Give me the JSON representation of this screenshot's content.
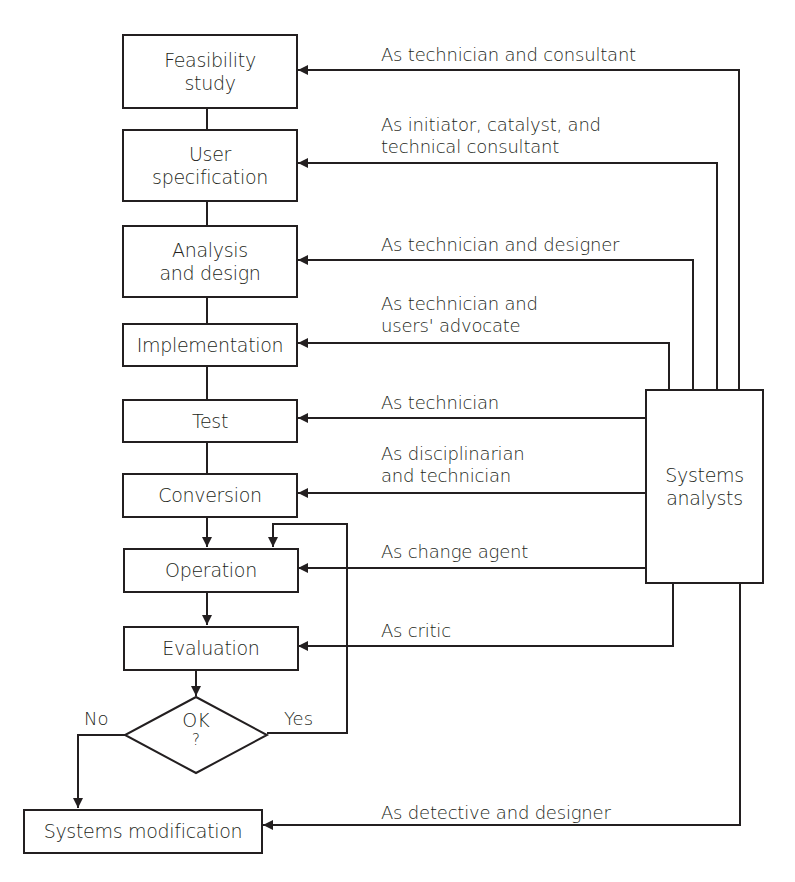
{
  "diagram": {
    "type": "flowchart",
    "stages": [
      {
        "id": "feasibility",
        "lines": [
          "Feasibility",
          "study"
        ]
      },
      {
        "id": "user-spec",
        "lines": [
          "User",
          "specification"
        ]
      },
      {
        "id": "analysis",
        "lines": [
          "Analysis",
          "and design"
        ]
      },
      {
        "id": "implementation",
        "lines": [
          "Implementation"
        ]
      },
      {
        "id": "test",
        "lines": [
          "Test"
        ]
      },
      {
        "id": "conversion",
        "lines": [
          "Conversion"
        ]
      },
      {
        "id": "operation",
        "lines": [
          "Operation"
        ]
      },
      {
        "id": "evaluation",
        "lines": [
          "Evaluation"
        ]
      },
      {
        "id": "systems-modification",
        "lines": [
          "Systems modification"
        ]
      }
    ],
    "decision": {
      "lines": [
        "OK",
        "?"
      ],
      "yes_label": "Yes",
      "no_label": "No"
    },
    "actor": {
      "lines": [
        "Systems",
        "analysts"
      ]
    },
    "roles": [
      {
        "target": "feasibility",
        "lines": [
          "As technician and consultant"
        ]
      },
      {
        "target": "user-spec",
        "lines": [
          "As initiator, catalyst, and",
          "technical consultant"
        ]
      },
      {
        "target": "analysis",
        "lines": [
          "As technician and designer"
        ]
      },
      {
        "target": "implementation",
        "lines": [
          "As technician and",
          "users' advocate"
        ]
      },
      {
        "target": "test",
        "lines": [
          "As technician"
        ]
      },
      {
        "target": "conversion",
        "lines": [
          "As disciplinarian",
          "and technician"
        ]
      },
      {
        "target": "operation",
        "lines": [
          "As change agent"
        ]
      },
      {
        "target": "evaluation",
        "lines": [
          "As critic"
        ]
      },
      {
        "target": "systems-modification",
        "lines": [
          "As detective and designer"
        ]
      }
    ],
    "colors": {
      "ink": "#231f20",
      "background": "#ffffff"
    }
  }
}
